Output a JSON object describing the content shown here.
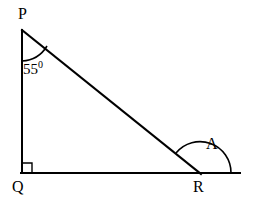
{
  "figure": {
    "type": "right-triangle-with-exterior-angle",
    "background_color": "#ffffff",
    "stroke_color": "#000000",
    "vertices": {
      "P": {
        "label": "P",
        "x": 22,
        "y": 30
      },
      "Q": {
        "label": "Q",
        "x": 22,
        "y": 173
      },
      "R": {
        "label": "R",
        "x": 200,
        "y": 173
      }
    },
    "segments": [
      {
        "name": "PQ",
        "from": "P",
        "to": "Q"
      },
      {
        "name": "PR",
        "from": "P",
        "to": "R"
      },
      {
        "name": "QR-extended",
        "from": "Q",
        "to": "baseline-end"
      }
    ],
    "baseline_end_x": 240,
    "angles": {
      "at_P": {
        "value": "55",
        "degree_symbol": "0",
        "text": "55",
        "marker": "arc"
      },
      "at_Q": {
        "value": "90",
        "marker": "right-angle-square"
      },
      "at_R_exterior": {
        "label": "A",
        "marker": "arc"
      }
    }
  }
}
